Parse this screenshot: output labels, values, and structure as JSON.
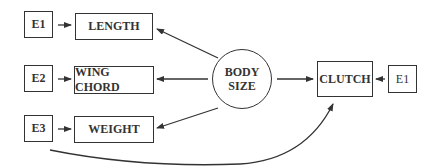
{
  "diagram": {
    "central_node": {
      "line1": "BODY",
      "line2": "SIZE"
    },
    "indicators": [
      {
        "label": "LENGTH",
        "error": "E1"
      },
      {
        "label": "WING CHORD",
        "error": "E2"
      },
      {
        "label": "WEIGHT",
        "error": "E3"
      }
    ],
    "outcome": {
      "label": "CLUTCH",
      "error": "E1"
    },
    "colors": {
      "line": "#333333",
      "background": "#ffffff"
    }
  }
}
